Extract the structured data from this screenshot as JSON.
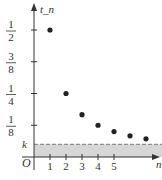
{
  "chart_data": {
    "type": "scatter",
    "title": "",
    "xlabel": "n",
    "ylabel": "t_n",
    "x": [
      1,
      2,
      3,
      4,
      5,
      6,
      7
    ],
    "series": [
      {
        "name": "t_n",
        "values": [
          0.5,
          0.25,
          0.1667,
          0.125,
          0.1,
          0.0833,
          0.0714
        ]
      }
    ],
    "x_ticks": [
      "1",
      "2",
      "3",
      "4",
      "5"
    ],
    "y_ticks": [
      {
        "label_num": "1",
        "label_den": "2",
        "value": 0.5
      },
      {
        "label_num": "3",
        "label_den": "8",
        "value": 0.375
      },
      {
        "label_num": "1",
        "label_den": "4",
        "value": 0.25
      },
      {
        "label_num": "1",
        "label_den": "8",
        "value": 0.125
      }
    ],
    "annotations": {
      "origin_label": "O",
      "band_label": "k",
      "band_value": 0.05,
      "band_style": "shaded region between x-axis and dashed line y=k"
    },
    "xlim": [
      0,
      7.5
    ],
    "ylim": [
      0,
      0.55
    ],
    "grid": false,
    "legend": "none",
    "colors": {
      "dots": "#222222",
      "band": "#d6d6d6",
      "axis": "#333333",
      "dash": "#777777"
    }
  }
}
